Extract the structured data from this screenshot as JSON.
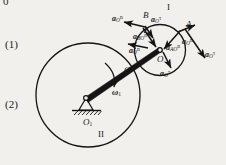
{
  "figure": {
    "margin_labels": [
      {
        "id": "item-1",
        "text": "(1)"
      },
      {
        "id": "item-2",
        "text": "(2)"
      }
    ],
    "cut_char": "0",
    "bodies": [
      {
        "id": "body-1",
        "roman": "I"
      },
      {
        "id": "body-2",
        "roman": "II"
      }
    ],
    "points": [
      {
        "id": "point-a",
        "text": "A"
      },
      {
        "id": "point-b",
        "text": "B"
      },
      {
        "id": "point-c",
        "text": "C"
      },
      {
        "id": "point-o",
        "text": "O"
      }
    ],
    "pivot_label": {
      "base": "O",
      "sub": "1"
    },
    "omega": {
      "symbol": "ω",
      "sub": "1"
    },
    "vectors": [
      {
        "id": "a-o-n-upper-left",
        "base": "a",
        "sub": "O",
        "sup": "n"
      },
      {
        "id": "a-o-tau-top",
        "base": "a",
        "sub": "O",
        "sup": "τ"
      },
      {
        "id": "a-bo-n",
        "base": "a",
        "sub": "BO",
        "sup": "n"
      },
      {
        "id": "a-o-n-left",
        "base": "a",
        "sub": "O",
        "sup": "n"
      },
      {
        "id": "a-ao-n-inner",
        "base": "a",
        "sub": "AO",
        "sup": "n"
      },
      {
        "id": "a-o-n-right",
        "base": "a",
        "sub": "O",
        "sup": "n"
      },
      {
        "id": "a-o-tau-right",
        "base": "a",
        "sub": "O",
        "sup": "τ"
      },
      {
        "id": "a-o-tau-bottom",
        "base": "a",
        "sub": "O",
        "sup": "τ"
      }
    ],
    "colors": {
      "ink": "#141414",
      "background": "#f2f0ec"
    }
  }
}
